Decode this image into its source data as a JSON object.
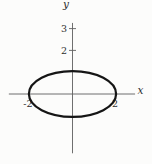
{
  "chart_data": {
    "type": "line",
    "title": "",
    "curve": {
      "shape": "ellipse",
      "equation": "x^2/4 + y^2 = 1",
      "center_x": 0,
      "center_y": 0,
      "semi_axis_x": 2,
      "semi_axis_y": 1.05
    },
    "xlabel": "x",
    "ylabel": "y",
    "xlim": [
      -2.92,
      2.87
    ],
    "ylim": [
      -2.72,
      3.26
    ],
    "grid": false,
    "x_tick_labels": [
      {
        "value": -2,
        "label": "-2"
      },
      {
        "value": 2,
        "label": "2"
      }
    ],
    "y_tick_labels": [
      {
        "value": 2,
        "label": "2"
      },
      {
        "value": 3,
        "label": "3"
      }
    ],
    "colors": {
      "axis": "#5f5f5f",
      "curve": "#151515",
      "text": "#2e2e2e",
      "background": "#fcfcfb"
    }
  }
}
